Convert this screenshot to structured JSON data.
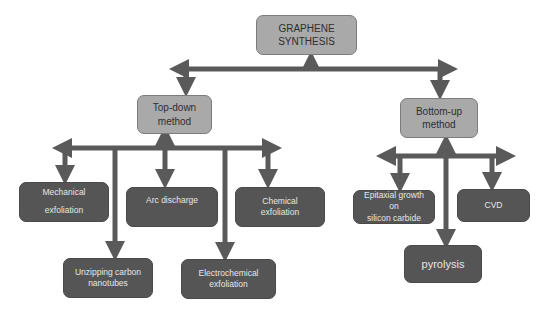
{
  "diagram": {
    "type": "tree",
    "root": {
      "label_line1": "GRAPHENE",
      "label_line2": "SYNTHESIS"
    },
    "branches": [
      {
        "label_line1": "Top-down",
        "label_line2": "method",
        "children": [
          {
            "label_line1": "Mechanical",
            "label_line2": "exfoliation"
          },
          {
            "label_line1": "Unzipping carbon",
            "label_line2": "nanotubes"
          },
          {
            "label_line1": "Arc discharge",
            "label_line2": ""
          },
          {
            "label_line1": "Electrochemical",
            "label_line2": "exfoliation"
          },
          {
            "label_line1": "Chemical exfoliation",
            "label_line2": ""
          }
        ]
      },
      {
        "label_line1": "Bottom-up",
        "label_line2": "method",
        "children": [
          {
            "label_line1": "Epitaxial growth on",
            "label_line2": "silicon carbide"
          },
          {
            "label_line1": "pyrolysis",
            "label_line2": ""
          },
          {
            "label_line1": "CVD",
            "label_line2": ""
          }
        ]
      }
    ],
    "colors": {
      "connector": "#5a5a5a",
      "light_box": "#a9a9a9",
      "dark_box": "#555555",
      "dark_text": "#e6e6e6",
      "light_text": "#2e2e2e"
    }
  }
}
